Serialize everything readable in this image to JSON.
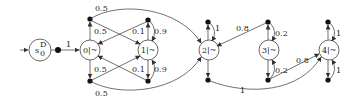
{
  "diagram": {
    "type": "markov-decision-process",
    "initial_state": {
      "label": "s",
      "sub": "0",
      "sup": "D"
    },
    "states": [
      {
        "id": "0",
        "label": "0|~"
      },
      {
        "id": "1",
        "label": "1|~"
      },
      {
        "id": "2",
        "label": "2|~"
      },
      {
        "id": "3",
        "label": "3|~"
      },
      {
        "id": "4",
        "label": "4|~"
      }
    ],
    "edges": [
      {
        "from": "s0",
        "to": "0",
        "prob": "1"
      },
      {
        "from": "0-top",
        "to": "1",
        "prob": "0.5"
      },
      {
        "from": "0-top",
        "to": "2",
        "prob": "0.5"
      },
      {
        "from": "1-top",
        "to": "0",
        "prob": "0.1"
      },
      {
        "from": "1-top",
        "to": "1",
        "prob": "0.9"
      },
      {
        "from": "0-bot",
        "to": "1",
        "prob": "0.5"
      },
      {
        "from": "0-bot",
        "to": "2",
        "prob": "0.5"
      },
      {
        "from": "1-bot",
        "to": "0",
        "prob": "0.1"
      },
      {
        "from": "1-bot",
        "to": "1",
        "prob": "0.9"
      },
      {
        "from": "2-top",
        "to": "2",
        "prob": "1"
      },
      {
        "from": "2-bot",
        "to": "4",
        "prob": "1"
      },
      {
        "from": "3-top",
        "to": "2",
        "prob": "0.8"
      },
      {
        "from": "3-top",
        "to": "3",
        "prob": "0.2"
      },
      {
        "from": "3-bot",
        "to": "3",
        "prob": "0.2"
      },
      {
        "from": "3-bot",
        "to": "4",
        "prob": "0.8"
      },
      {
        "from": "4-top",
        "to": "4",
        "prob": "1"
      },
      {
        "from": "4-bot",
        "to": "4",
        "prob": "1"
      }
    ],
    "labels": {
      "s0_main": "s",
      "s0_sub": "0",
      "s0_sup": "D",
      "p_s0_0": "1",
      "p_0top_2": "0.5",
      "p_0top_1": "0.5",
      "p_1top_0": "0.1",
      "p_1top_1": "0.9",
      "p_0bot_1": "0.5",
      "p_1bot_0": "0.1",
      "p_1bot_1": "0.9",
      "p_0bot_2": "0.5",
      "p_2top": "1",
      "p_3top_2": "0.8",
      "p_3top_3": "0.2",
      "p_3bot_3": "0.2",
      "p_3bot_4": "0.8",
      "p_2bot_4": "1",
      "p_4top": "1",
      "p_4bot": "1",
      "n0": "0|~",
      "n1": "1|~",
      "n2": "2|~",
      "n3": "3|~",
      "n4": "4|~"
    }
  }
}
